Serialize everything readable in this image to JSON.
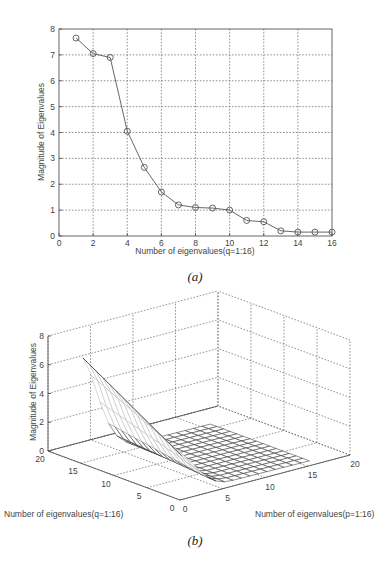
{
  "chart_data": [
    {
      "id": "a",
      "type": "line",
      "title": "",
      "caption": "(a)",
      "xlabel": "Number of eigenvalues(q=1:16)",
      "ylabel": "Magnitude of Eigenvalues",
      "xlim": [
        0,
        16
      ],
      "ylim": [
        0,
        8
      ],
      "xticks": [
        "0",
        "2",
        "4",
        "6",
        "8",
        "10",
        "12",
        "14",
        "16"
      ],
      "yticks": [
        "0",
        "1",
        "2",
        "3",
        "4",
        "5",
        "6",
        "7",
        "8"
      ],
      "grid": true,
      "marker": "circle",
      "series": [
        {
          "name": "eigenvalues",
          "x": [
            1,
            2,
            3,
            4,
            5,
            6,
            7,
            8,
            9,
            10,
            11,
            12,
            13,
            14,
            15,
            16
          ],
          "values": [
            7.65,
            7.05,
            6.9,
            4.05,
            2.65,
            1.7,
            1.2,
            1.1,
            1.08,
            1.0,
            0.6,
            0.55,
            0.2,
            0.15,
            0.15,
            0.15
          ]
        }
      ]
    },
    {
      "id": "b",
      "type": "surface",
      "caption": "(b)",
      "xlabel": "Number of eigenvalues(p=1:16)",
      "ylabel": "Number of eigenvalues(q=1:16)",
      "zlabel": "Magnitude of Eigenvalues",
      "xlim": [
        0,
        20
      ],
      "ylim": [
        0,
        20
      ],
      "zlim": [
        0,
        8
      ],
      "xticks": [
        "0",
        "5",
        "10",
        "15",
        "20"
      ],
      "yticks": [
        "0",
        "5",
        "10",
        "15",
        "20"
      ],
      "zticks": [
        "0",
        "2",
        "4",
        "6",
        "8"
      ],
      "grid": true,
      "description": "Mesh surface over p,q in 1..16; high ridge (~7) along low p values, decaying steeply to near 0 for larger p, flat mesh floor elsewhere"
    }
  ]
}
